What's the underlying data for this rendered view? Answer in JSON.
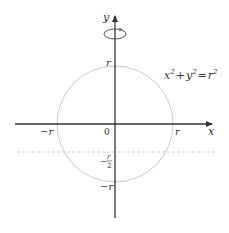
{
  "diagram": {
    "equation": {
      "base_x": "x",
      "sup_x": "2",
      "plus": "+",
      "base_y": "y",
      "sup_y": "2",
      "equals": "=",
      "base_r": "r",
      "sup_r": "2"
    },
    "axes": {
      "x_label": "x",
      "y_label": "y",
      "origin_label": "0"
    },
    "tick_labels": {
      "x_positive": "r",
      "x_negative": "−r",
      "y_positive": "r",
      "y_negative": "−r",
      "y_half_neg_sign": "−",
      "y_half_num": "r",
      "y_half_den": "2"
    },
    "elements": {
      "rotation_icon": "rotation-arrow-around-y-axis",
      "circle": "circle-radius-r",
      "dashed_line": "horizontal-line-y-equals-minus-r-over-2"
    },
    "colors": {
      "axis": "#333333",
      "circle": "#c8c8c8",
      "dashed_line": "#d0d0d0",
      "rotation": "#555555",
      "text": "#333333"
    }
  }
}
